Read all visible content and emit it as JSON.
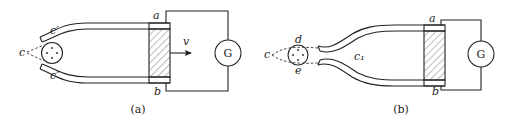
{
  "figure": {
    "panels": [
      {
        "id": "a",
        "caption": "(a)",
        "labels": {
          "source": "c",
          "upper_lip": "c′",
          "lower_lip": "c″",
          "terminal_top": "a",
          "terminal_bottom": "b",
          "velocity": "v",
          "meter": "G"
        }
      },
      {
        "id": "b",
        "caption": "(b)",
        "labels": {
          "source": "c",
          "upper_point": "d",
          "lower_point": "e",
          "throat": "c₁",
          "terminal_top": "a",
          "terminal_bottom": "b",
          "meter": "G"
        }
      }
    ],
    "colors": {
      "stroke": "#222222",
      "background": "#ffffff"
    }
  }
}
